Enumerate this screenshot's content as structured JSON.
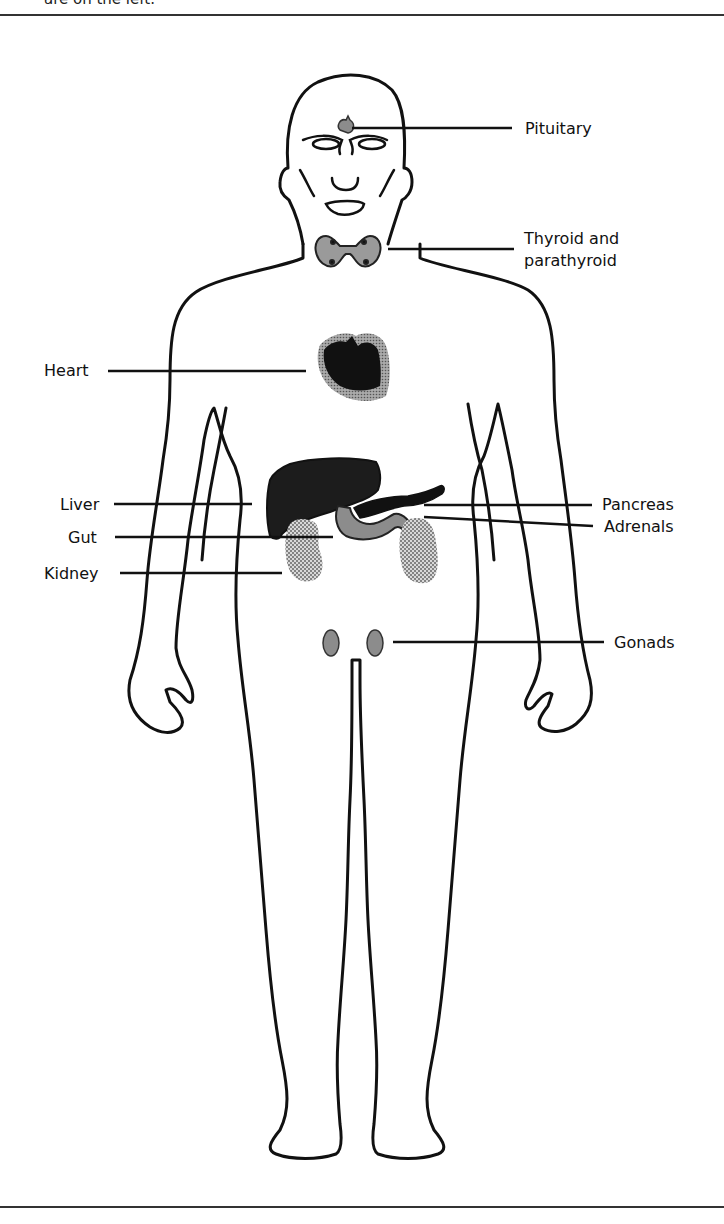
{
  "caption_fragment": "are on the left.",
  "figure": {
    "type": "anatomical-diagram",
    "labels": {
      "pituitary": "Pituitary",
      "thyroid_line1": "Thyroid and",
      "thyroid_line2": "parathyroid",
      "heart": "Heart",
      "liver": "Liver",
      "gut": "Gut",
      "kidney": "Kidney",
      "pancreas": "Pancreas",
      "adrenals": "Adrenals",
      "gonads": "Gonads"
    },
    "colors": {
      "outline": "#111111",
      "dark_organ": "#1a1a1a",
      "mid_gray": "#8c8c8c",
      "light_stipple": "#b5b5b5"
    }
  }
}
